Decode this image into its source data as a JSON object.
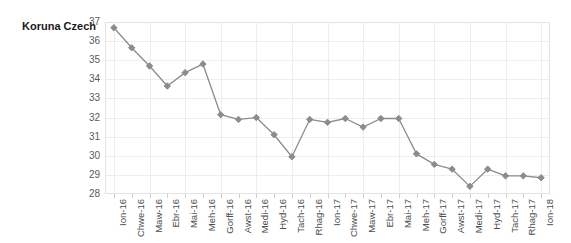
{
  "chart_data": {
    "type": "line",
    "title": "Koruna Czech",
    "xlabel": "",
    "ylabel": "",
    "ylim": [
      28,
      37
    ],
    "ytick_step": 1,
    "yticks": [
      37,
      36,
      35,
      34,
      33,
      32,
      31,
      30,
      29,
      28
    ],
    "grid": true,
    "legend": "none",
    "series_color": "#8c8c8c",
    "marker": "diamond",
    "categories": [
      "Ion-16",
      "Chwe-16",
      "Maw-16",
      "Ebr-16",
      "Mai-16",
      "Meh-16",
      "Gorff-16",
      "Awst-16",
      "Medi-16",
      "Hyd-16",
      "Tach-16",
      "Rhag-16",
      "Ion-17",
      "Chwe-17",
      "Maw-17",
      "Ebr-17",
      "Mai-17",
      "Meh-17",
      "Gorff-17",
      "Awst-17",
      "Medi-17",
      "Hyd-17",
      "Tach-17",
      "Rhag-17",
      "Ion-18"
    ],
    "values": [
      36.7,
      35.65,
      34.7,
      33.65,
      34.35,
      34.8,
      32.15,
      31.9,
      32.0,
      31.1,
      29.95,
      31.9,
      31.75,
      31.95,
      31.5,
      31.95,
      31.95,
      30.1,
      29.55,
      29.3,
      28.4,
      29.3,
      28.95,
      28.95,
      28.85
    ]
  }
}
